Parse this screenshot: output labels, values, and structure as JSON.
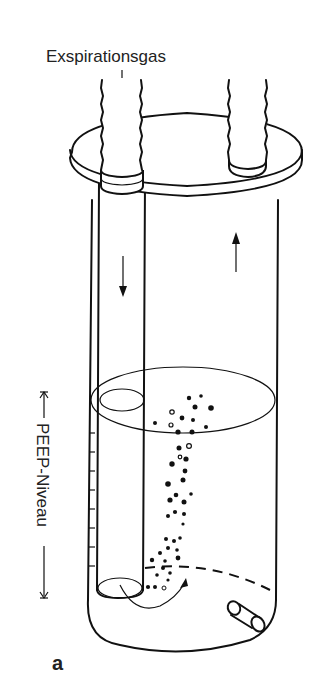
{
  "figure": {
    "title_label": "Exspirationsgas",
    "side_label": "PEEP-Niveau",
    "panel_label": "a",
    "colors": {
      "line": "#111111",
      "background": "#ffffff",
      "text": "#222222"
    },
    "components": [
      "expiratory-gas-hose",
      "outlet-hose",
      "lid",
      "cylinder",
      "inner-tube",
      "water-surface",
      "bubbles",
      "drain-valve",
      "scale-ticks"
    ]
  }
}
